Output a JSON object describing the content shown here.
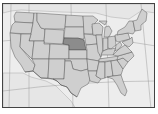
{
  "map": {
    "type": "choropleth-locator",
    "region": "Contiguous United States",
    "highlighted_state": "Nebraska",
    "colors": {
      "background": "#ededed",
      "state_fill": "#cfcfcf",
      "highlight_fill": "#8c8c8c",
      "border": "#5a5a5a",
      "frame": "#444444"
    }
  }
}
